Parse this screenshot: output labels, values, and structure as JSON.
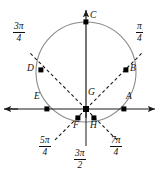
{
  "figure": {
    "colors": {
      "stroke": "#1a1a1a",
      "circle": "#7a7a7a",
      "dash": "#1a1a1a",
      "point": "#000000",
      "background": "#ffffff"
    }
  },
  "geometry": {
    "origin": {
      "x": 86,
      "y": 109
    },
    "circle": {
      "cx": 86,
      "cy": 72,
      "r": 50
    },
    "x_axis": {
      "y": 109,
      "x1": 4,
      "x2": 160
    },
    "y_axis": {
      "x": 86,
      "y1": 8,
      "y2": 147
    }
  },
  "points": [
    {
      "id": "A",
      "label": "A",
      "x": 124,
      "y": 109,
      "label_x": 126,
      "label_y": 97
    },
    {
      "id": "B",
      "label": "B",
      "x": 126,
      "y": 70,
      "label_x": 130,
      "label_y": 68
    },
    {
      "id": "C",
      "label": "C",
      "x": 86,
      "y": 22,
      "label_x": 90,
      "label_y": 13
    },
    {
      "id": "D",
      "label": "D",
      "x": 41,
      "y": 70,
      "label_x": 28,
      "label_y": 68
    },
    {
      "id": "E",
      "label": "E",
      "x": 47,
      "y": 109,
      "label_x": 35,
      "label_y": 97
    },
    {
      "id": "F",
      "label": "F",
      "x": 78,
      "y": 118,
      "label_x": 73,
      "label_y": 121
    },
    {
      "id": "G",
      "label": "G",
      "x": 86,
      "y": 109,
      "label_x": 88,
      "label_y": 92
    },
    {
      "id": "H",
      "label": "H",
      "x": 94,
      "y": 118,
      "label_x": 90,
      "label_y": 121
    }
  ],
  "angle_labels": [
    {
      "id": "three-pi-over-four",
      "numerator": "3π",
      "denominator": "4",
      "x": 17,
      "y": 26
    },
    {
      "id": "pi-over-four",
      "numerator": "π",
      "denominator": "4",
      "x": 135,
      "y": 26
    },
    {
      "id": "five-pi-over-four",
      "numerator": "5π",
      "denominator": "4",
      "x": 43,
      "y": 136
    },
    {
      "id": "three-pi-over-two",
      "numerator": "3π",
      "denominator": "2",
      "x": 78,
      "y": 150
    },
    {
      "id": "seven-pi-over-four",
      "numerator": "7π",
      "denominator": "4",
      "x": 110,
      "y": 136
    }
  ],
  "dashed_rays": [
    {
      "id": "ray-pi-over-four",
      "x1": 86,
      "y1": 109,
      "x2": 140,
      "y2": 55
    },
    {
      "id": "ray-three-pi-over-four",
      "x1": 86,
      "y1": 109,
      "x2": 32,
      "y2": 55
    },
    {
      "id": "ray-five-pi-over-four",
      "x1": 86,
      "y1": 109,
      "x2": 55,
      "y2": 140
    },
    {
      "id": "ray-seven-pi-over-four",
      "x1": 86,
      "y1": 109,
      "x2": 117,
      "y2": 140
    }
  ]
}
